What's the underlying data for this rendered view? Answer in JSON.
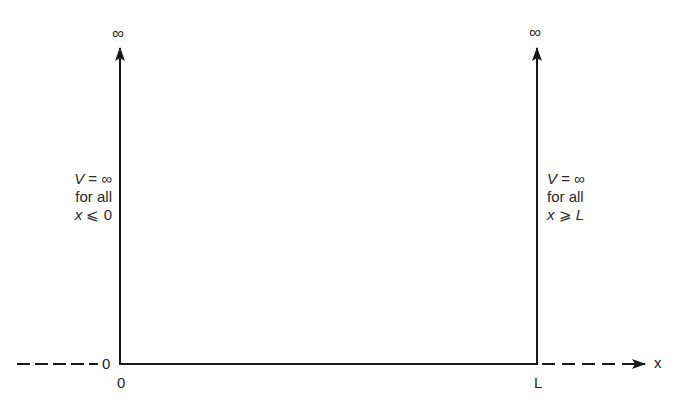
{
  "diagram": {
    "type": "infinite-square-well",
    "colors": {
      "line": "#1a1a1a",
      "text": "#2a2a2a",
      "background": "#ffffff"
    },
    "left_wall": {
      "top_label": "∞",
      "potential": {
        "var": "V",
        "eq": " = ∞"
      },
      "condition_text": "for all",
      "range": {
        "var": "x",
        "rel": " ⩽ 0"
      }
    },
    "right_wall": {
      "top_label": "∞",
      "potential": {
        "var": "V",
        "eq": " = ∞"
      },
      "condition_text": "for all",
      "range": {
        "var": "x",
        "rel": " ⩾ ",
        "var2": "L"
      }
    },
    "axis": {
      "label": "x",
      "origin_side_label": "0",
      "ticks": [
        {
          "label": "0",
          "position": "left-wall"
        },
        {
          "label": "L",
          "position": "right-wall"
        }
      ]
    }
  }
}
